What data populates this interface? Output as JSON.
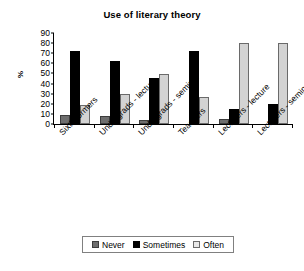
{
  "chart_data": {
    "type": "bar",
    "title": "Use of literary theory",
    "xlabel": "",
    "ylabel": "%",
    "ylim": [
      0,
      90
    ],
    "yticks": [
      0,
      10,
      20,
      30,
      40,
      50,
      60,
      70,
      80,
      90
    ],
    "grid": false,
    "legend_position": "bottom",
    "categories": [
      "Sixth formers",
      "Undergrads - lecture",
      "Undergrads - seminar",
      "Teachers",
      "Lecturers - lecture",
      "Lecturers - seminar"
    ],
    "series": [
      {
        "name": "Never",
        "color": "#6e6e6e",
        "values": [
          9,
          8,
          4,
          0,
          5,
          0
        ]
      },
      {
        "name": "Sometimes",
        "color": "#000000",
        "values": [
          72,
          62,
          46,
          72,
          15,
          20
        ]
      },
      {
        "name": "Often",
        "color": "#d3d3d3",
        "values": [
          19,
          30,
          49,
          27,
          80,
          80
        ]
      }
    ]
  },
  "legend": {
    "items": [
      {
        "label": "Never"
      },
      {
        "label": "Sometimes"
      },
      {
        "label": "Often"
      }
    ]
  }
}
